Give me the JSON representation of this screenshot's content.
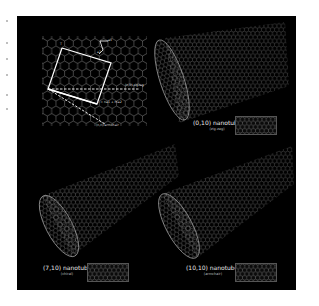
{
  "figure": {
    "background": "#000000",
    "page_background": "#ffffff",
    "line_color": "#d9d9d9"
  },
  "lattice_diagram": {
    "vector_labels": {
      "a1": "a1",
      "a2": "a2",
      "t": "T"
    },
    "chiral_vector_label": "C = na1 + ma2",
    "zigzag_axis_label": "(n,0) zigzag",
    "armchair_axis_label": "(n,n) armchair"
  },
  "nanotubes": [
    {
      "title": "(0,10) nanotube",
      "type": "(zig-zag)"
    },
    {
      "title": "(7,10) nanotube",
      "type": "(chiral)"
    },
    {
      "title": "(10,10) nanotube",
      "type": "(armchair)"
    }
  ]
}
